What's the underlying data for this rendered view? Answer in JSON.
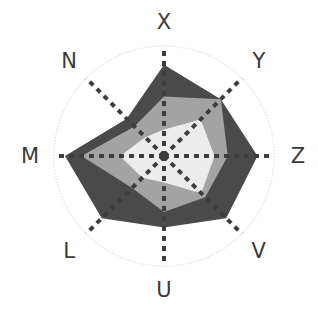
{
  "chart_data": {
    "type": "radar",
    "title": "",
    "axes": [
      "X",
      "Y",
      "Z",
      "V",
      "U",
      "L",
      "M",
      "N"
    ],
    "axis_angles_deg": [
      0,
      45,
      90,
      135,
      180,
      225,
      270,
      315
    ],
    "scale_max": 100,
    "outer_circle": true,
    "grid_style": "dashed spokes",
    "series": [
      {
        "name": "outer",
        "color": "#4a4a4a",
        "values": [
          83,
          73,
          85,
          80,
          65,
          80,
          90,
          48
        ]
      },
      {
        "name": "middle",
        "color": "#a3a3a3",
        "values": [
          54,
          73,
          58,
          53,
          51,
          41,
          75,
          38
        ]
      },
      {
        "name": "inner",
        "color": "#ececec",
        "values": [
          24,
          47,
          46,
          48,
          24,
          28,
          40,
          24
        ]
      }
    ],
    "legend": null
  },
  "layout": {
    "center_x": 164,
    "center_y": 156,
    "radius": 110,
    "label_radius": 134,
    "spoke_color": "#3d3d3d",
    "circle_color": "#e6e6e6"
  }
}
